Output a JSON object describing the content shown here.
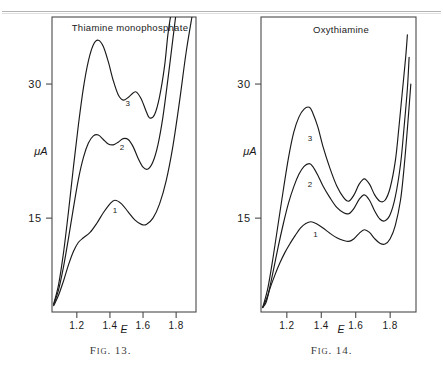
{
  "page": {
    "rule_present": true,
    "background_color": "#ffffff",
    "ink_color": "#1a1a1a"
  },
  "figures": [
    {
      "id": "fig-13",
      "caption_prefix": "F",
      "caption_smallcaps": "IG",
      "caption_number": ". 13.",
      "caption_full": "FIG. 13.",
      "plot_title": "Thiamine   monophosphate",
      "axes": {
        "ylabel": "μA",
        "xlabel": "E",
        "y_ticks": [
          {
            "label": "30",
            "value": 30
          },
          {
            "label": "15",
            "value": 15
          }
        ],
        "x_ticks": [
          {
            "label": "1.2",
            "value": 1.2
          },
          {
            "label": "1.4",
            "value": 1.4
          },
          {
            "label": "1.6",
            "value": 1.6
          },
          {
            "label": "1.8",
            "value": 1.8
          }
        ]
      },
      "curve_labels": [
        {
          "text": "1",
          "curve": 1
        },
        {
          "text": "2",
          "curve": 2
        },
        {
          "text": "3",
          "curve": 3
        }
      ]
    },
    {
      "id": "fig-14",
      "caption_prefix": "F",
      "caption_smallcaps": "IG",
      "caption_number": ". 14.",
      "caption_full": "FIG. 14.",
      "plot_title": "Oxythiamine",
      "axes": {
        "ylabel": "μA",
        "xlabel": "E",
        "y_ticks": [
          {
            "label": "30",
            "value": 30
          },
          {
            "label": "15",
            "value": 15
          }
        ],
        "x_ticks": [
          {
            "label": "1.2",
            "value": 1.2
          },
          {
            "label": "1.4",
            "value": 1.4
          },
          {
            "label": "1.6",
            "value": 1.6
          },
          {
            "label": "1.8",
            "value": 1.8
          }
        ]
      },
      "curve_labels": [
        {
          "text": "1",
          "curve": 1
        },
        {
          "text": "2",
          "curve": 2
        },
        {
          "text": "3",
          "curve": 3
        }
      ]
    }
  ],
  "chart_data": [
    {
      "type": "line",
      "title": "Thiamine   monophosphate",
      "xlabel": "E",
      "ylabel": "μA",
      "xlim": [
        1.05,
        1.92
      ],
      "ylim": [
        4.5,
        37.5
      ],
      "xticks": [
        1.2,
        1.4,
        1.6,
        1.8
      ],
      "yticks": [
        15,
        30
      ],
      "grid": false,
      "legend": "inline curve numbers (1, 2, 3)",
      "annotations": [
        {
          "text": "1",
          "x": 1.43,
          "y": 16.6
        },
        {
          "text": "2",
          "x": 1.46,
          "y": 23.6
        },
        {
          "text": "3",
          "x": 1.49,
          "y": 28.6
        }
      ],
      "series": [
        {
          "name": "1",
          "points": [
            [
              1.06,
              5.2
            ],
            [
              1.09,
              6.4
            ],
            [
              1.12,
              8.0
            ],
            [
              1.15,
              9.8
            ],
            [
              1.18,
              11.3
            ],
            [
              1.21,
              12.3
            ],
            [
              1.24,
              12.8
            ],
            [
              1.28,
              13.4
            ],
            [
              1.32,
              14.4
            ],
            [
              1.36,
              15.6
            ],
            [
              1.4,
              16.6
            ],
            [
              1.43,
              17.0
            ],
            [
              1.47,
              16.6
            ],
            [
              1.51,
              15.7
            ],
            [
              1.55,
              14.8
            ],
            [
              1.59,
              14.3
            ],
            [
              1.62,
              14.3
            ],
            [
              1.66,
              15.0
            ],
            [
              1.7,
              16.6
            ],
            [
              1.74,
              19.2
            ],
            [
              1.78,
              23.0
            ],
            [
              1.82,
              28.0
            ],
            [
              1.86,
              33.5
            ],
            [
              1.9,
              38.0
            ]
          ]
        },
        {
          "name": "2",
          "points": [
            [
              1.06,
              5.3
            ],
            [
              1.09,
              7.0
            ],
            [
              1.12,
              9.6
            ],
            [
              1.15,
              12.8
            ],
            [
              1.18,
              16.2
            ],
            [
              1.21,
              19.4
            ],
            [
              1.24,
              21.8
            ],
            [
              1.27,
              23.4
            ],
            [
              1.3,
              24.2
            ],
            [
              1.33,
              24.3
            ],
            [
              1.36,
              23.8
            ],
            [
              1.39,
              23.3
            ],
            [
              1.42,
              23.2
            ],
            [
              1.45,
              23.5
            ],
            [
              1.48,
              23.9
            ],
            [
              1.51,
              23.8
            ],
            [
              1.54,
              23.0
            ],
            [
              1.57,
              21.7
            ],
            [
              1.6,
              20.7
            ],
            [
              1.63,
              20.5
            ],
            [
              1.66,
              21.3
            ],
            [
              1.69,
              23.2
            ],
            [
              1.72,
              26.3
            ],
            [
              1.75,
              30.5
            ],
            [
              1.78,
              35.0
            ],
            [
              1.8,
              38.0
            ]
          ]
        },
        {
          "name": "3",
          "points": [
            [
              1.06,
              5.4
            ],
            [
              1.09,
              7.6
            ],
            [
              1.12,
              11.2
            ],
            [
              1.15,
              15.8
            ],
            [
              1.18,
              20.8
            ],
            [
              1.21,
              25.5
            ],
            [
              1.24,
              29.6
            ],
            [
              1.27,
              32.6
            ],
            [
              1.3,
              34.4
            ],
            [
              1.33,
              34.9
            ],
            [
              1.36,
              34.2
            ],
            [
              1.39,
              32.5
            ],
            [
              1.42,
              30.4
            ],
            [
              1.45,
              28.8
            ],
            [
              1.48,
              28.2
            ],
            [
              1.51,
              28.5
            ],
            [
              1.54,
              29.0
            ],
            [
              1.56,
              29.1
            ],
            [
              1.59,
              28.3
            ],
            [
              1.62,
              26.9
            ],
            [
              1.64,
              26.2
            ],
            [
              1.67,
              26.6
            ],
            [
              1.7,
              28.6
            ],
            [
              1.73,
              32.0
            ],
            [
              1.75,
              35.5
            ],
            [
              1.77,
              38.0
            ]
          ]
        }
      ]
    },
    {
      "type": "line",
      "title": "Oxythiamine",
      "xlabel": "E",
      "ylabel": "μA",
      "xlim": [
        1.05,
        1.95
      ],
      "ylim": [
        4.5,
        37.5
      ],
      "xticks": [
        1.2,
        1.4,
        1.6,
        1.8
      ],
      "yticks": [
        15,
        30
      ],
      "grid": false,
      "legend": "inline curve numbers (1, 2, 3)",
      "annotations": [
        {
          "text": "1",
          "x": 1.36,
          "y": 14.0
        },
        {
          "text": "2",
          "x": 1.34,
          "y": 19.6
        },
        {
          "text": "3",
          "x": 1.34,
          "y": 24.8
        }
      ],
      "series": [
        {
          "name": "1",
          "points": [
            [
              1.06,
              5.0
            ],
            [
              1.08,
              5.6
            ],
            [
              1.1,
              7.0
            ],
            [
              1.13,
              8.6
            ],
            [
              1.16,
              10.0
            ],
            [
              1.19,
              11.2
            ],
            [
              1.22,
              12.2
            ],
            [
              1.25,
              13.1
            ],
            [
              1.28,
              13.9
            ],
            [
              1.31,
              14.4
            ],
            [
              1.34,
              14.6
            ],
            [
              1.37,
              14.4
            ],
            [
              1.41,
              13.9
            ],
            [
              1.45,
              13.3
            ],
            [
              1.49,
              12.8
            ],
            [
              1.53,
              12.5
            ],
            [
              1.56,
              12.4
            ],
            [
              1.59,
              12.7
            ],
            [
              1.62,
              13.3
            ],
            [
              1.65,
              13.7
            ],
            [
              1.68,
              13.4
            ],
            [
              1.71,
              12.7
            ],
            [
              1.74,
              12.2
            ],
            [
              1.77,
              12.1
            ],
            [
              1.8,
              12.7
            ],
            [
              1.83,
              14.2
            ],
            [
              1.86,
              17.0
            ],
            [
              1.88,
              20.5
            ],
            [
              1.9,
              25.0
            ],
            [
              1.92,
              30.0
            ]
          ]
        },
        {
          "name": "2",
          "points": [
            [
              1.06,
              5.0
            ],
            [
              1.09,
              6.4
            ],
            [
              1.12,
              9.0
            ],
            [
              1.15,
              11.8
            ],
            [
              1.18,
              14.4
            ],
            [
              1.21,
              16.7
            ],
            [
              1.24,
              18.5
            ],
            [
              1.27,
              19.9
            ],
            [
              1.3,
              20.8
            ],
            [
              1.33,
              21.1
            ],
            [
              1.35,
              20.8
            ],
            [
              1.38,
              19.8
            ],
            [
              1.41,
              18.6
            ],
            [
              1.45,
              17.3
            ],
            [
              1.49,
              16.2
            ],
            [
              1.53,
              15.6
            ],
            [
              1.56,
              15.5
            ],
            [
              1.59,
              16.1
            ],
            [
              1.62,
              17.1
            ],
            [
              1.65,
              17.6
            ],
            [
              1.68,
              17.0
            ],
            [
              1.71,
              15.8
            ],
            [
              1.74,
              14.9
            ],
            [
              1.77,
              14.7
            ],
            [
              1.8,
              15.4
            ],
            [
              1.83,
              17.4
            ],
            [
              1.86,
              21.0
            ],
            [
              1.88,
              25.0
            ],
            [
              1.9,
              29.5
            ],
            [
              1.91,
              33.0
            ]
          ]
        },
        {
          "name": "3",
          "points": [
            [
              1.06,
              5.0
            ],
            [
              1.09,
              7.2
            ],
            [
              1.12,
              10.6
            ],
            [
              1.15,
              14.4
            ],
            [
              1.18,
              18.2
            ],
            [
              1.21,
              21.8
            ],
            [
              1.24,
              24.6
            ],
            [
              1.27,
              26.3
            ],
            [
              1.3,
              27.2
            ],
            [
              1.33,
              27.4
            ],
            [
              1.35,
              26.8
            ],
            [
              1.38,
              25.2
            ],
            [
              1.41,
              23.0
            ],
            [
              1.45,
              20.6
            ],
            [
              1.49,
              18.6
            ],
            [
              1.53,
              17.3
            ],
            [
              1.56,
              16.9
            ],
            [
              1.59,
              17.6
            ],
            [
              1.62,
              18.8
            ],
            [
              1.65,
              19.4
            ],
            [
              1.68,
              18.8
            ],
            [
              1.71,
              17.6
            ],
            [
              1.74,
              16.9
            ],
            [
              1.77,
              17.0
            ],
            [
              1.8,
              18.4
            ],
            [
              1.83,
              21.4
            ],
            [
              1.85,
              25.0
            ],
            [
              1.87,
              29.0
            ],
            [
              1.89,
              33.0
            ],
            [
              1.9,
              35.5
            ]
          ]
        }
      ]
    }
  ]
}
